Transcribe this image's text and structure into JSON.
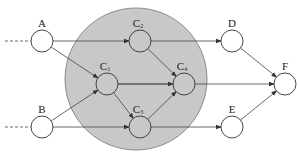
{
  "diagram": {
    "region": {
      "cx": 136,
      "cy": 79,
      "r": 71,
      "fill": "#c8c8c8"
    },
    "nodes": [
      {
        "id": "A",
        "label": "A",
        "sub": "",
        "x": 42,
        "y": 41
      },
      {
        "id": "B",
        "label": "B",
        "sub": "",
        "x": 42,
        "y": 127
      },
      {
        "id": "C2",
        "label": "C",
        "sub": "2",
        "x": 140,
        "y": 41
      },
      {
        "id": "C1",
        "label": "C",
        "sub": "1",
        "x": 107,
        "y": 84
      },
      {
        "id": "C4",
        "label": "C",
        "sub": "4",
        "x": 184,
        "y": 84
      },
      {
        "id": "C3",
        "label": "C",
        "sub": "3",
        "x": 140,
        "y": 127
      },
      {
        "id": "D",
        "label": "D",
        "sub": "",
        "x": 232,
        "y": 41
      },
      {
        "id": "E",
        "label": "E",
        "sub": "",
        "x": 232,
        "y": 127
      },
      {
        "id": "F",
        "label": "F",
        "sub": "",
        "x": 285,
        "y": 84
      }
    ],
    "edges": [
      [
        "A",
        "C2"
      ],
      [
        "A",
        "C1"
      ],
      [
        "B",
        "C1"
      ],
      [
        "B",
        "C3"
      ],
      [
        "C2",
        "D"
      ],
      [
        "C2",
        "C4"
      ],
      [
        "C1",
        "C4"
      ],
      [
        "C1",
        "C3"
      ],
      [
        "C3",
        "C4"
      ],
      [
        "C1",
        "F"
      ],
      [
        "C3",
        "E"
      ],
      [
        "D",
        "F"
      ],
      [
        "E",
        "F"
      ]
    ],
    "inputs": [
      {
        "to": "A",
        "y": 41
      },
      {
        "to": "B",
        "y": 127
      }
    ]
  }
}
